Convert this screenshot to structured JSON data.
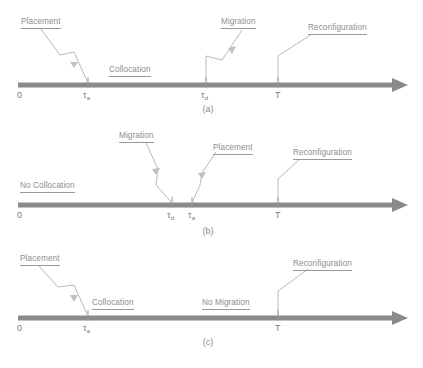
{
  "figure": {
    "type": "timeline-diagram",
    "panel_count": 3,
    "colors": {
      "background": "#ffffff",
      "axis": "#8a8a8a",
      "label_text": "#8d8d8d",
      "leader_line": "#b0b0b0",
      "tick": "#9a9a9a"
    }
  },
  "panels": [
    {
      "id": "a",
      "caption": "(a)",
      "origin_label": "0",
      "ticks": [
        {
          "name": "tau-a",
          "symbol": "τ",
          "subscript": "a",
          "x": 88
        },
        {
          "name": "tau-d",
          "symbol": "τ",
          "subscript": "d",
          "x": 206
        },
        {
          "name": "T",
          "symbol": "T",
          "subscript": "",
          "x": 278
        }
      ],
      "interval_labels": [
        {
          "name": "collocation-label",
          "text": "Collocation"
        }
      ],
      "event_labels": [
        {
          "name": "placement-label",
          "text": "Placement"
        },
        {
          "name": "migration-label",
          "text": "Migration"
        },
        {
          "name": "reconfiguration-label",
          "text": "Reconfiguration"
        }
      ]
    },
    {
      "id": "b",
      "caption": "(b)",
      "origin_label": "0",
      "ticks": [
        {
          "name": "tau-d",
          "symbol": "τ",
          "subscript": "d",
          "x": 172
        },
        {
          "name": "tau-a",
          "symbol": "τ",
          "subscript": "a",
          "x": 192
        },
        {
          "name": "T",
          "symbol": "T",
          "subscript": "",
          "x": 278
        }
      ],
      "interval_labels": [
        {
          "name": "no-collocation-label",
          "text": "No Collocation"
        }
      ],
      "event_labels": [
        {
          "name": "migration-label",
          "text": "Migration"
        },
        {
          "name": "placement-label",
          "text": "Placement"
        },
        {
          "name": "reconfiguration-label",
          "text": "Reconfiguration"
        }
      ]
    },
    {
      "id": "c",
      "caption": "(c)",
      "origin_label": "0",
      "ticks": [
        {
          "name": "tau-a",
          "symbol": "τ",
          "subscript": "a",
          "x": 88
        },
        {
          "name": "T",
          "symbol": "T",
          "subscript": "",
          "x": 278
        }
      ],
      "interval_labels": [
        {
          "name": "collocation-label",
          "text": "Collocation"
        },
        {
          "name": "no-migration-label",
          "text": "No Migration"
        }
      ],
      "event_labels": [
        {
          "name": "placement-label",
          "text": "Placement"
        },
        {
          "name": "reconfiguration-label",
          "text": "Reconfiguration"
        }
      ]
    }
  ],
  "text": {
    "panel_a": {
      "placement": "Placement",
      "migration": "Migration",
      "reconfiguration": "Reconfiguration",
      "collocation": "Collocation",
      "zero": "0",
      "tau_a": "τ",
      "tau_a_sub": "a",
      "tau_d": "τ",
      "tau_d_sub": "d",
      "T": "T",
      "caption": "(a)"
    },
    "panel_b": {
      "migration": "Migration",
      "placement": "Placement",
      "reconfiguration": "Reconfiguration",
      "no_collocation": "No Collocation",
      "zero": "0",
      "tau_d": "τ",
      "tau_d_sub": "d",
      "tau_a": "τ",
      "tau_a_sub": "a",
      "T": "T",
      "caption": "(b)"
    },
    "panel_c": {
      "placement": "Placement",
      "reconfiguration": "Reconfiguration",
      "collocation": "Collocation",
      "no_migration": "No Migration",
      "zero": "0",
      "tau_a": "τ",
      "tau_a_sub": "a",
      "T": "T",
      "caption": "(c)"
    }
  }
}
